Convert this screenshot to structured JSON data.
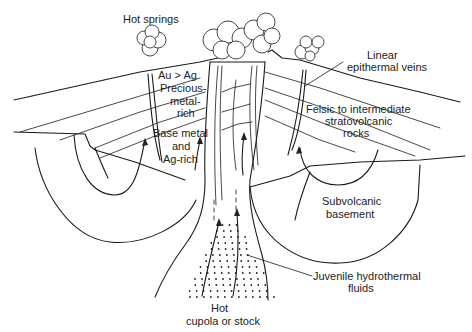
{
  "diagram": {
    "type": "geological-cross-section",
    "labels": {
      "hot_springs": "Hot springs",
      "au_ag": "Au > Ag",
      "precious_1": "Precious-",
      "precious_2": "metal-",
      "precious_3": "rich",
      "base_1": "Base metal",
      "base_2": "and",
      "base_3": "Ag-rich",
      "linear_1": "Linear",
      "linear_2": "epithermal veins",
      "felsic_1": "Felsic to intermediate",
      "felsic_2": "stratovolcanic",
      "felsic_3": "rocks",
      "subvolcanic_1": "Subvolcanic",
      "subvolcanic_2": "basement",
      "juvenile_1": "Juvenile hydrothermal",
      "juvenile_2": "fluids",
      "hot_1": "Hot",
      "hot_2": "cupola or stock"
    },
    "colors": {
      "line": "#1a1a1a",
      "background": "#ffffff",
      "text": "#222222"
    }
  }
}
